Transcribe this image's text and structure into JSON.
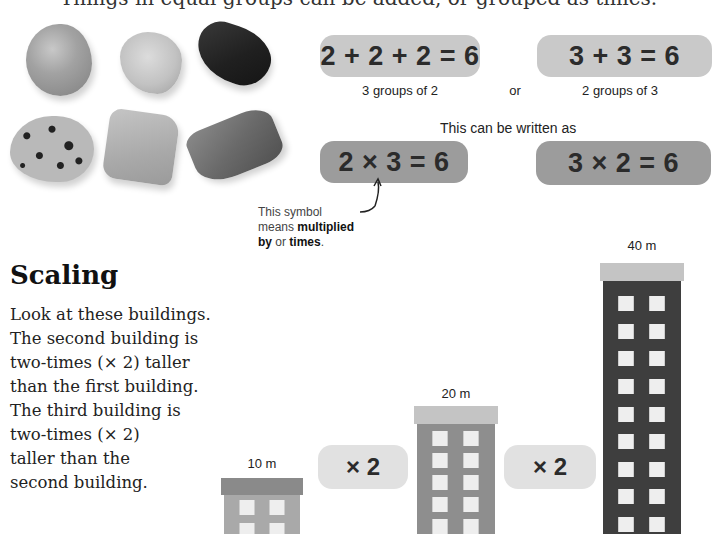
{
  "header": {
    "clipped_line": "Things in equal groups can be added, or grouped as times."
  },
  "stones": {
    "items": [
      {
        "name": "orange-stone"
      },
      {
        "name": "pale-stone"
      },
      {
        "name": "black-stone"
      },
      {
        "name": "spotted-stone"
      },
      {
        "name": "flat-stone"
      },
      {
        "name": "grey-stone"
      }
    ]
  },
  "addition": {
    "left": {
      "equation": "2 + 2 + 2 = 6",
      "caption": "3 groups of 2"
    },
    "connector": "or",
    "right": {
      "equation": "3 + 3 = 6",
      "caption": "2 groups of 3"
    }
  },
  "written_as": "This can be written as",
  "multiplication": {
    "left": {
      "equation": "2 × 3 = 6"
    },
    "right": {
      "equation": "3 × 2 = 6"
    }
  },
  "note": {
    "line1": "This symbol",
    "line2_prefix": "means ",
    "line2_bold": "multiplied",
    "line3_bold1": "by",
    "line3_mid": " or ",
    "line3_bold2": "times",
    "line3_end": "."
  },
  "scaling": {
    "heading": "Scaling",
    "paragraph_lines": [
      "Look at these buildings.",
      "The second building is",
      "two-times (× 2) taller",
      "than the first building.",
      "The third building is",
      "two-times (× 2)",
      "taller than the",
      "second building."
    ]
  },
  "buildings": [
    {
      "label": "10 m",
      "shade": "#a9a9a9",
      "roof": "#8a8a8a"
    },
    {
      "label": "20 m",
      "shade": "#8e8e8e",
      "roof": "#c4c4c4"
    },
    {
      "label": "40 m",
      "shade": "#3e3e3e",
      "roof": "#c4c4c4"
    }
  ],
  "multipliers": [
    "× 2",
    "× 2"
  ],
  "colors": {
    "light_box": "#c9c9c9",
    "dark_box": "#9c9c9c",
    "times_box": "#e1e1e1",
    "text": "#2b2b2b"
  }
}
